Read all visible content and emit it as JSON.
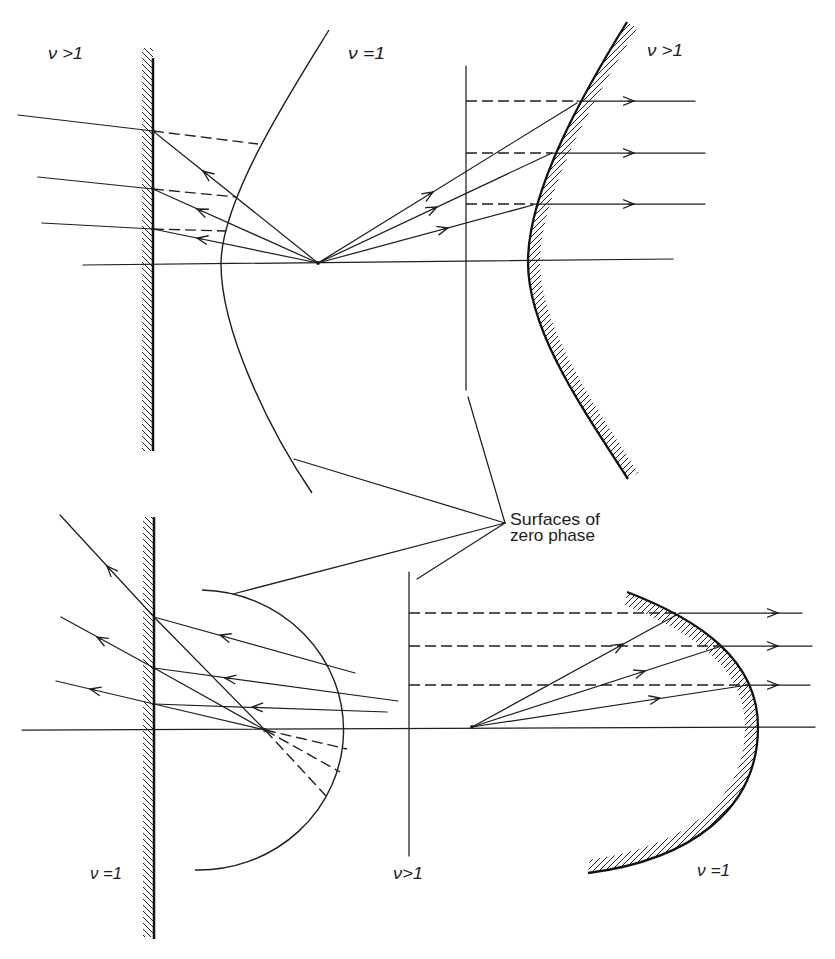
{
  "figure": {
    "type": "ray-optics diagram",
    "panels": [
      "top-left",
      "top-right",
      "bottom-left",
      "bottom-right"
    ]
  },
  "labels": {
    "top_left_region": "ν >1",
    "top_left_curve": "ν =1",
    "top_right_region": "ν >1",
    "bottom_left_region": "ν =1",
    "bottom_middle_region": "ν>1",
    "bottom_right_region": "ν =1"
  },
  "annotation": {
    "line1": "Surfaces of",
    "line2": "zero phase"
  },
  "colors": {
    "ink": "#1e1e1e",
    "paper": "#ffffff"
  }
}
